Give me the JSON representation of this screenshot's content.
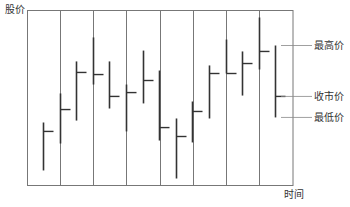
{
  "chart_data": {
    "type": "bar",
    "subtype": "ohlc-high-low-close",
    "title": "",
    "xlabel": "时间",
    "ylabel": "股价",
    "ylim": [
      0,
      100
    ],
    "grid": "vertical",
    "legend": "right (annotations on last bar)",
    "periods": 15,
    "bars": [
      {
        "high": 36.0,
        "low": 8.6,
        "close": 30.9
      },
      {
        "high": 52.6,
        "low": 24.0,
        "close": 43.4
      },
      {
        "high": 70.9,
        "low": 37.1,
        "close": 64.6
      },
      {
        "high": 84.6,
        "low": 57.7,
        "close": 63.4
      },
      {
        "high": 70.9,
        "low": 44.0,
        "close": 50.9
      },
      {
        "high": 57.7,
        "low": 30.9,
        "close": 53.1
      },
      {
        "high": 77.1,
        "low": 46.9,
        "close": 60.0
      },
      {
        "high": 65.7,
        "low": 25.7,
        "close": 33.1
      },
      {
        "high": 38.3,
        "low": 4.0,
        "close": 28.0
      },
      {
        "high": 48.0,
        "low": 24.6,
        "close": 42.3
      },
      {
        "high": 68.6,
        "low": 38.3,
        "close": 64.0
      },
      {
        "high": 83.4,
        "low": 64.0,
        "close": 64.0
      },
      {
        "high": 76.6,
        "low": 51.4,
        "close": 69.7
      },
      {
        "high": 96.0,
        "low": 66.3,
        "close": 76.6
      },
      {
        "high": 80.0,
        "low": 38.9,
        "close": 50.9
      }
    ],
    "annotations": [
      {
        "target": "high",
        "label": "最高价"
      },
      {
        "target": "close",
        "label": "收市价"
      },
      {
        "target": "low",
        "label": "最低价"
      }
    ]
  },
  "colors": {
    "frame": "#777777",
    "bar": "#333333",
    "text": "#333333"
  }
}
